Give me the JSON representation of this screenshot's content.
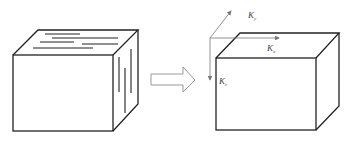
{
  "figure": {
    "left_block": {
      "name": "layered block"
    },
    "arrow": {
      "name": "transform arrow"
    },
    "right_block": {
      "name": "equivalent block"
    },
    "axes": {
      "ky": {
        "letter": "K",
        "subscript": "y"
      },
      "kx": {
        "letter": "K",
        "subscript": "x"
      },
      "kz": {
        "letter": "K",
        "subscript": "z"
      }
    }
  },
  "colors": {
    "stroke": "#222222",
    "axis": "#777777",
    "arrow": "#888888"
  }
}
